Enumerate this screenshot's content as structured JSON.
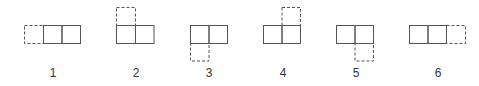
{
  "diagram": {
    "colors": {
      "stroke": "#555555",
      "background": "#ffffff"
    },
    "figures": [
      {
        "label": "1",
        "added_cell": "left"
      },
      {
        "label": "2",
        "added_cell": "top-left"
      },
      {
        "label": "3",
        "added_cell": "bottom-left"
      },
      {
        "label": "4",
        "added_cell": "top-right"
      },
      {
        "label": "5",
        "added_cell": "bottom-right"
      },
      {
        "label": "6",
        "added_cell": "right"
      }
    ]
  }
}
